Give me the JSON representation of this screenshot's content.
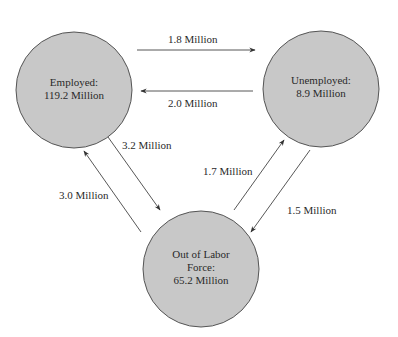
{
  "diagram": {
    "type": "labor-market-flows",
    "node_fill": "#c8c8c8",
    "node_stroke": "#555555",
    "arrow_color": "#444444",
    "nodes": [
      {
        "id": "employed",
        "line1": "Employed:",
        "line2": "119.2 Million"
      },
      {
        "id": "unemployed",
        "line1": "Unemployed:",
        "line2": "8.9 Million"
      },
      {
        "id": "out_of_labor_force",
        "line1": "Out of Labor",
        "line2": "Force:",
        "line3": "65.2 Million"
      }
    ],
    "flows": [
      {
        "from": "employed",
        "to": "unemployed",
        "label": "1.8 Million"
      },
      {
        "from": "unemployed",
        "to": "employed",
        "label": "2.0 Million"
      },
      {
        "from": "employed",
        "to": "out_of_labor_force",
        "label": "3.2 Million"
      },
      {
        "from": "out_of_labor_force",
        "to": "employed",
        "label": "3.0 Million"
      },
      {
        "from": "out_of_labor_force",
        "to": "unemployed",
        "label": "1.7 Million"
      },
      {
        "from": "unemployed",
        "to": "out_of_labor_force",
        "label": "1.5 Million"
      }
    ]
  }
}
